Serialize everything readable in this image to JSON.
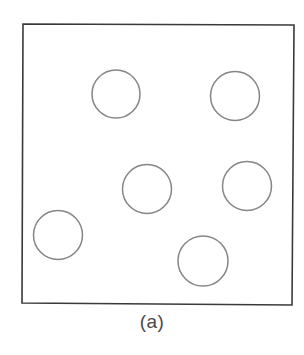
{
  "figure": {
    "caption": "(a)",
    "frame": {
      "corners": [
        [
          23,
          24
        ],
        [
          294,
          25
        ],
        [
          292,
          305
        ],
        [
          22,
          303
        ]
      ],
      "stroke": "#3a3a3a",
      "stroke_width": 1.6
    },
    "circles": [
      {
        "id": 1,
        "cx": 116,
        "cy": 94,
        "r": 24
      },
      {
        "id": 2,
        "cx": 235,
        "cy": 96,
        "r": 24.5
      },
      {
        "id": 3,
        "cx": 147,
        "cy": 189,
        "r": 24.5
      },
      {
        "id": 4,
        "cx": 247,
        "cy": 186,
        "r": 24.5
      },
      {
        "id": 5,
        "cx": 58,
        "cy": 235,
        "r": 24.5
      },
      {
        "id": 6,
        "cx": 203,
        "cy": 261,
        "r": 25
      }
    ],
    "circle_stroke": "#858585",
    "circle_stroke_width": 1.5,
    "background": "#ffffff"
  }
}
